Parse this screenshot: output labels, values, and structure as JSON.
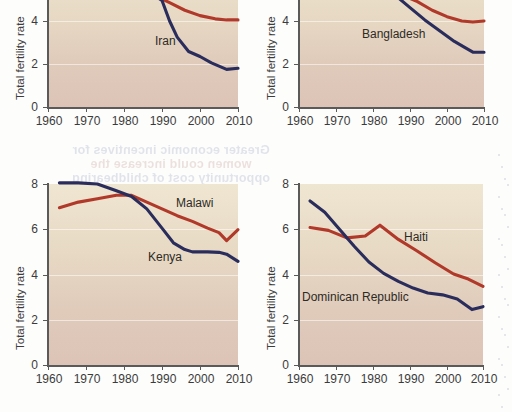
{
  "figure": {
    "axis_title_y": "Total fertility rate",
    "y_ticks_top": [
      "4",
      "2",
      "0"
    ],
    "y_ticks_bottom": [
      "8",
      "6",
      "4",
      "2",
      "0"
    ],
    "x_ticks": [
      "1960",
      "1970",
      "1980",
      "1990",
      "2000",
      "2010"
    ],
    "colors": {
      "navy": "#2a2d5c",
      "red": "#b0392a",
      "plot_bg_top": "#efe6d2",
      "plot_bg_bottom": "#dcc3b6",
      "axis": "#5a5a5a",
      "text": "#3b3b3b"
    },
    "bleed_through_text": {
      "line1": "Greater economic incentives for",
      "line2": "women could increase the",
      "line3": "opportunity cost of childbearing"
    }
  },
  "chart_data": [
    {
      "id": "iran",
      "type": "line",
      "title": "",
      "xlabel": "",
      "ylabel": "Total fertility rate",
      "xlim": [
        1960,
        2010
      ],
      "ylim": [
        0,
        5.2
      ],
      "y_visible_range": [
        0,
        5.2
      ],
      "grid": true,
      "legend": "inline-annotation",
      "annotations": [
        {
          "text": "Iran",
          "x": 1988,
          "y": 3.05
        }
      ],
      "series": [
        {
          "name": "Iran",
          "color": "#2a2d5c",
          "x": [
            1988,
            1990,
            1992,
            1994,
            1997,
            2000,
            2003,
            2007,
            2010
          ],
          "values": [
            5.2,
            4.95,
            4.0,
            3.25,
            2.58,
            2.35,
            2.05,
            1.75,
            1.8
          ]
        },
        {
          "name": "comparison-red",
          "color": "#b0392a",
          "x": [
            1988,
            1992,
            1996,
            2000,
            2004,
            2007,
            2010
          ],
          "values": [
            5.2,
            4.85,
            4.5,
            4.25,
            4.1,
            4.05,
            4.05
          ]
        }
      ]
    },
    {
      "id": "bangladesh",
      "type": "line",
      "title": "",
      "xlabel": "",
      "ylabel": "Total fertility rate",
      "xlim": [
        1960,
        2010
      ],
      "ylim": [
        0,
        5.2
      ],
      "grid": true,
      "legend": "inline-annotation",
      "annotations": [
        {
          "text": "Bangladesh",
          "x": 1986,
          "y": 3.1
        }
      ],
      "series": [
        {
          "name": "Bangladesh",
          "color": "#2a2d5c",
          "x": [
            1986,
            1990,
            1994,
            1998,
            2002,
            2005,
            2007,
            2010
          ],
          "values": [
            5.2,
            4.62,
            4.05,
            3.55,
            3.05,
            2.75,
            2.55,
            2.55
          ]
        },
        {
          "name": "comparison-red",
          "color": "#b0392a",
          "x": [
            1988,
            1992,
            1996,
            2000,
            2004,
            2007,
            2010
          ],
          "values": [
            5.2,
            4.9,
            4.5,
            4.2,
            4.0,
            3.95,
            4.0
          ]
        }
      ]
    },
    {
      "id": "malawi-kenya",
      "type": "line",
      "title": "",
      "xlabel": "",
      "ylabel": "Total fertility rate",
      "xlim": [
        1960,
        2010
      ],
      "ylim": [
        0,
        8.4
      ],
      "grid": true,
      "legend": "inline-annotation",
      "annotations": [
        {
          "text": "Malawi",
          "x": 1993,
          "y": 7.05
        },
        {
          "text": "Kenya",
          "x": 1988,
          "y": 5.25
        }
      ],
      "series": [
        {
          "name": "Kenya",
          "color": "#2a2d5c",
          "x": [
            1963,
            1968,
            1973,
            1978,
            1982,
            1986,
            1990,
            1993,
            1996,
            1998,
            2002,
            2005,
            2007,
            2010
          ],
          "values": [
            8.05,
            8.05,
            8.0,
            7.7,
            7.45,
            6.9,
            6.05,
            5.4,
            5.1,
            5.0,
            5.0,
            4.98,
            4.9,
            4.58
          ]
        },
        {
          "name": "Malawi",
          "color": "#b0392a",
          "x": [
            1963,
            1968,
            1973,
            1978,
            1982,
            1986,
            1990,
            1994,
            1998,
            2002,
            2005,
            2007,
            2010
          ],
          "values": [
            6.95,
            7.2,
            7.35,
            7.5,
            7.5,
            7.2,
            6.9,
            6.6,
            6.35,
            6.05,
            5.85,
            5.5,
            5.98
          ]
        }
      ]
    },
    {
      "id": "haiti-dominican-republic",
      "type": "line",
      "title": "",
      "xlabel": "",
      "ylabel": "Total fertility rate",
      "xlim": [
        1960,
        2010
      ],
      "ylim": [
        0,
        8.4
      ],
      "grid": true,
      "legend": "inline-annotation",
      "annotations": [
        {
          "text": "Haiti",
          "x": 1992,
          "y": 5.45
        },
        {
          "text": "Dominican Republic",
          "x": 1964,
          "y": 3.2
        }
      ],
      "series": [
        {
          "name": "Dominican Republic",
          "color": "#2a2d5c",
          "x": [
            1963,
            1967,
            1971,
            1975,
            1979,
            1983,
            1987,
            1991,
            1995,
            1999,
            2003,
            2007,
            2010
          ],
          "values": [
            7.25,
            6.75,
            6.0,
            5.25,
            4.55,
            4.05,
            3.7,
            3.4,
            3.18,
            3.1,
            2.92,
            2.45,
            2.58
          ]
        },
        {
          "name": "Haiti",
          "color": "#b0392a",
          "x": [
            1963,
            1968,
            1973,
            1978,
            1982,
            1987,
            1992,
            1997,
            2002,
            2006,
            2010
          ],
          "values": [
            6.08,
            5.95,
            5.62,
            5.7,
            6.18,
            5.55,
            5.05,
            4.52,
            4.02,
            3.8,
            3.48
          ]
        }
      ]
    }
  ]
}
